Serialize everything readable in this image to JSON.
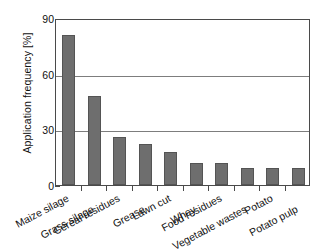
{
  "chart_data": {
    "type": "bar",
    "title": "",
    "subtitle": "",
    "xlabel": "",
    "ylabel": "Application frequency [%]",
    "ylim": [
      0,
      90
    ],
    "yticks": [
      0,
      30,
      60,
      90
    ],
    "grid": true,
    "legend": false,
    "legend_position": "none",
    "bar_color": "#6e6e6e",
    "bar_edge_color": "#545454",
    "axis_color": "#4a4a4a",
    "categories": [
      "Maize silage",
      "Grass silage",
      "Cereal residues",
      "Grease",
      "Lawn cut",
      "Whey",
      "Food residues",
      "Vegetable wastes",
      "Potato",
      "Potato pulp"
    ],
    "values": [
      81,
      48,
      26,
      22,
      18,
      12,
      12,
      9,
      9,
      9
    ]
  },
  "axes": {
    "y_tick_labels": [
      "0",
      "30",
      "60",
      "90"
    ],
    "y_axis_title": "Application frequency [%]"
  }
}
